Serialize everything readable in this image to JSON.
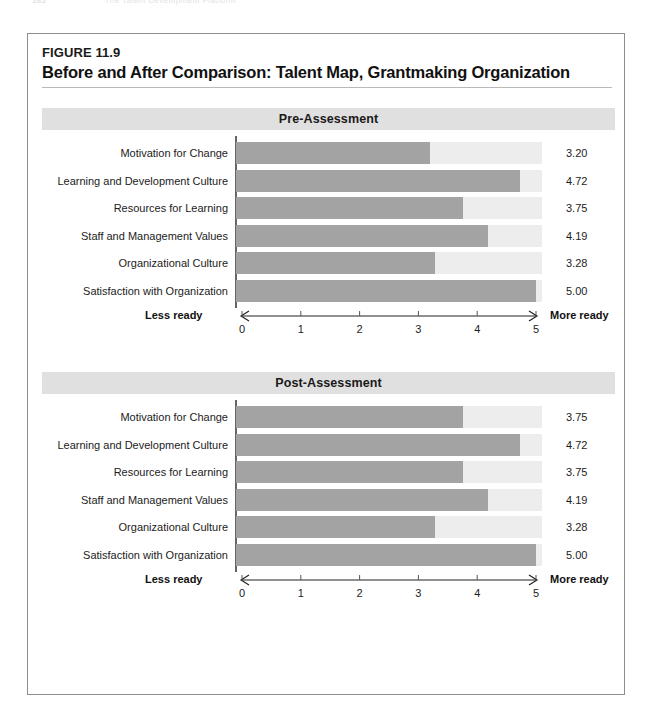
{
  "page": {
    "running_head_folio": "162",
    "running_head_text": "The Talent Development Platform"
  },
  "figure": {
    "number_label": "FIGURE 11.9",
    "title": "Before and After Comparison: Talent Map, Grantmaking Organization"
  },
  "axis": {
    "left_caption": "Less ready",
    "right_caption": "More ready",
    "ticks": [
      "0",
      "1",
      "2",
      "3",
      "4",
      "5"
    ],
    "min": 0,
    "max": 5
  },
  "colors": {
    "bar_fill": "#a3a3a3",
    "bar_track": "#ededed",
    "section_band": "#e0e0e0",
    "frame_border": "#8d8d8d",
    "title_rule": "#b9b9b9"
  },
  "sections": [
    {
      "id": "pre",
      "label": "Pre-Assessment"
    },
    {
      "id": "post",
      "label": "Post-Assessment"
    }
  ],
  "chart_data": [
    {
      "type": "bar",
      "orientation": "horizontal",
      "title": "Pre-Assessment",
      "xlabel": "",
      "ylabel": "",
      "xlim": [
        0,
        5
      ],
      "xticks": [
        0,
        1,
        2,
        3,
        4,
        5
      ],
      "grid": false,
      "legend": "none",
      "axis_annotations": {
        "left": "Less ready",
        "right": "More ready"
      },
      "categories": [
        "Motivation for Change",
        "Learning and Development Culture",
        "Resources for Learning",
        "Staff and Management Values",
        "Organizational Culture",
        "Satisfaction with Organization"
      ],
      "values": [
        3.2,
        4.72,
        3.75,
        4.19,
        3.28,
        5.0
      ],
      "value_labels": [
        "3.20",
        "4.72",
        "3.75",
        "4.19",
        "3.28",
        "5.00"
      ]
    },
    {
      "type": "bar",
      "orientation": "horizontal",
      "title": "Post-Assessment",
      "xlabel": "",
      "ylabel": "",
      "xlim": [
        0,
        5
      ],
      "xticks": [
        0,
        1,
        2,
        3,
        4,
        5
      ],
      "grid": false,
      "legend": "none",
      "axis_annotations": {
        "left": "Less ready",
        "right": "More ready"
      },
      "categories": [
        "Motivation for Change",
        "Learning and Development Culture",
        "Resources for Learning",
        "Staff and Management Values",
        "Organizational Culture",
        "Satisfaction with Organization"
      ],
      "values": [
        3.75,
        4.72,
        3.75,
        4.19,
        3.28,
        5.0
      ],
      "value_labels": [
        "3.75",
        "4.72",
        "3.75",
        "4.19",
        "3.28",
        "5.00"
      ]
    }
  ]
}
